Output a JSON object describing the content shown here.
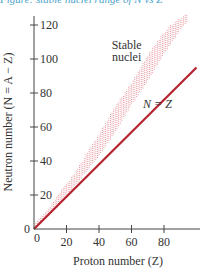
{
  "caption": "Figure: stable nuclei range of N vs Z",
  "chart_data": {
    "type": "scatter",
    "title": "",
    "xlabel": "Proton number (Z)",
    "ylabel": "Neutron number (N = A − Z)",
    "xlim": [
      0,
      100
    ],
    "ylim": [
      0,
      125
    ],
    "x_ticks": [
      0,
      20,
      40,
      60,
      80
    ],
    "y_ticks": [
      0,
      20,
      40,
      60,
      80,
      100,
      120
    ],
    "grid": false,
    "annotations": [
      {
        "text": "Stable",
        "x": 57,
        "y": 106
      },
      {
        "text": "nuclei",
        "x": 57,
        "y": 99
      },
      {
        "text": "N = Z",
        "x": 76,
        "y": 71
      }
    ],
    "series": [
      {
        "name": "N = Z",
        "type": "line",
        "color": "#b5232e",
        "x": [
          0,
          100
        ],
        "y": [
          0,
          95
        ]
      },
      {
        "name": "Stable nuclei",
        "type": "band",
        "color": "#d9606b",
        "x": [
          0,
          10,
          20,
          30,
          40,
          50,
          60,
          70,
          80,
          90,
          94
        ],
        "y_low": [
          0,
          10,
          20,
          32,
          44,
          58,
          74,
          88,
          104,
          118,
          122
        ],
        "y_high": [
          2,
          13,
          26,
          40,
          56,
          72,
          86,
          102,
          116,
          124,
          126
        ]
      }
    ]
  }
}
